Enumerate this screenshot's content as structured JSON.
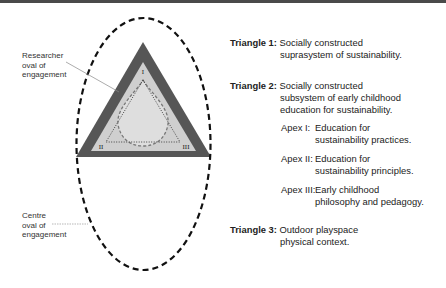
{
  "diagram": {
    "colors": {
      "outer_triangle": "#565656",
      "middle_triangle": "#cfcfcf",
      "inner_fill": "#dedede",
      "oval_stroke": "#111111",
      "top_bar": "#4a4a4a"
    },
    "apex_labels": [
      "I",
      "II",
      "III"
    ],
    "callouts": {
      "researcher": [
        "Researcher",
        "oval of",
        "engagement"
      ],
      "centre": [
        "Centre",
        "oval of",
        "engagement"
      ]
    }
  },
  "legend": {
    "triangle1": {
      "title": "Triangle 1:",
      "line1": "Socially constructed",
      "line2": "suprasystem of sustainability."
    },
    "triangle2": {
      "title": "Triangle 2:",
      "line1": "Socially constructed",
      "line2": "subsystem of early childhood",
      "line3": "education for sustainability."
    },
    "apex1": {
      "title": "Apex I:",
      "line1": "Education for",
      "line2": "sustainability practices."
    },
    "apex2": {
      "title": "Apex II:",
      "line1": "Education for",
      "line2": "sustainability principles."
    },
    "apex3": {
      "title": "Apex III:",
      "line1": "Early childhood",
      "line2": "philosophy and pedagogy."
    },
    "triangle3": {
      "title": "Triangle 3:",
      "line1": "Outdoor playspace",
      "line2": "physical context."
    }
  }
}
